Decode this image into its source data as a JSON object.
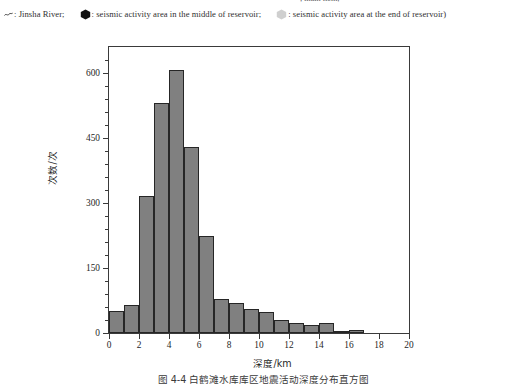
{
  "figure": {
    "clipped_top_line": "; main item;",
    "legend": {
      "river_marker_name": "tilde-line-marker",
      "river_label": ": Jinsha River;",
      "dark_hex_name": "dark-hexagon-marker",
      "dark_hex_label": ": seismic activity area in the middle of reservoir;",
      "light_hex_name": "light-hexagon-marker",
      "light_hex_label": ": seismic activity area at the end of reservoir)",
      "dark_hex_color": "#1a1a1a",
      "light_hex_color": "#cfcfcf"
    },
    "caption_clipped": "图 4-4  白鹤滩水库库区地震活动深度分布直方图"
  },
  "chart_data": {
    "type": "bar",
    "title": "",
    "xlabel": "深度/km",
    "ylabel": "次数/次",
    "xlim": [
      0,
      20
    ],
    "ylim": [
      0,
      660
    ],
    "xticks": [
      0,
      2,
      4,
      6,
      8,
      10,
      12,
      14,
      16,
      18,
      20
    ],
    "yticks": [
      0,
      150,
      300,
      450,
      600
    ],
    "y_minor_step": 30,
    "grid": false,
    "legend_position": "none",
    "bin_width": 1,
    "bin_edges": [
      0,
      1,
      2,
      3,
      4,
      5,
      6,
      7,
      8,
      9,
      10,
      11,
      12,
      13,
      14,
      15,
      16,
      17,
      18,
      19,
      20
    ],
    "categories": [
      "0-1",
      "1-2",
      "2-3",
      "3-4",
      "4-5",
      "5-6",
      "6-7",
      "7-8",
      "8-9",
      "9-10",
      "10-11",
      "11-12",
      "12-13",
      "13-14",
      "14-15",
      "15-16",
      "16-17",
      "17-18",
      "18-19",
      "19-20"
    ],
    "values": [
      50,
      64,
      316,
      530,
      606,
      430,
      225,
      78,
      70,
      55,
      48,
      30,
      22,
      18,
      22,
      3,
      8,
      0,
      0,
      0
    ],
    "bar_fill": "#808080",
    "bar_edge": "#262626"
  },
  "axis": {
    "y_labels": [
      "600",
      "450",
      "300",
      "150",
      "0"
    ],
    "x_labels": [
      "0",
      "2",
      "4",
      "6",
      "8",
      "10",
      "12",
      "14",
      "16",
      "18",
      "20"
    ]
  }
}
